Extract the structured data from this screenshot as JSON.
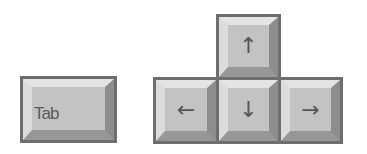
{
  "keys": {
    "tab": {
      "label": "Tab"
    },
    "up": {
      "glyph": "↑"
    },
    "left": {
      "glyph": "←"
    },
    "down": {
      "glyph": "↓"
    },
    "right": {
      "glyph": "→"
    }
  },
  "colors": {
    "key_border": "#6e6e6e",
    "key_face": "#c3c3c3",
    "bevel_light": "#e4e4e4",
    "bevel_dark": "#8d8d8d",
    "glyph": "#555555",
    "background": "#ffffff"
  }
}
